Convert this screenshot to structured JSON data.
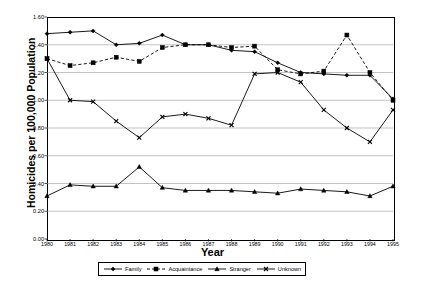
{
  "chart_data": {
    "type": "line",
    "title": "",
    "xlabel": "Year",
    "ylabel": "Homicides per 100,000 Population",
    "xlim": [
      1980,
      1995
    ],
    "ylim": [
      0.0,
      1.6
    ],
    "grid": true,
    "legend_position": "bottom",
    "categories": [
      "1980",
      "1981",
      "1982",
      "1983",
      "1984",
      "1985",
      "1986",
      "1987",
      "1988",
      "1989",
      "1990",
      "1991",
      "1992",
      "1993",
      "1994",
      "1995"
    ],
    "x": [
      1980,
      1981,
      1982,
      1983,
      1984,
      1985,
      1986,
      1987,
      1988,
      1989,
      1990,
      1991,
      1992,
      1993,
      1994,
      1995
    ],
    "ytick_labels": [
      "0.00",
      "0.20",
      "0.40",
      "0.60",
      "0.80",
      "1.00",
      "1.20",
      "1.40",
      "1.60"
    ],
    "ytick_values": [
      0.0,
      0.2,
      0.4,
      0.6,
      0.8,
      1.0,
      1.2,
      1.4,
      1.6
    ],
    "xtick_labels": [
      "1980",
      "1981",
      "1982",
      "1983",
      "1984",
      "1985",
      "1986",
      "1987",
      "1988",
      "1989",
      "1990",
      "1991",
      "1992",
      "1993",
      "1994",
      "1995"
    ],
    "series": [
      {
        "name": "Family",
        "marker": "diamond",
        "dash": "solid",
        "color": "#000000",
        "values": [
          1.48,
          1.49,
          1.5,
          1.4,
          1.41,
          1.47,
          1.4,
          1.4,
          1.36,
          1.35,
          1.27,
          1.2,
          1.19,
          1.18,
          1.18,
          1.01
        ]
      },
      {
        "name": "Acquaintance",
        "marker": "square",
        "dash": "dashed",
        "color": "#000000",
        "values": [
          1.3,
          1.25,
          1.27,
          1.31,
          1.28,
          1.38,
          1.4,
          1.4,
          1.38,
          1.39,
          1.22,
          1.19,
          1.21,
          1.47,
          1.2,
          1.0
        ]
      },
      {
        "name": "Stranger",
        "marker": "triangle",
        "dash": "solid",
        "color": "#000000",
        "values": [
          0.31,
          0.39,
          0.38,
          0.38,
          0.52,
          0.37,
          0.35,
          0.35,
          0.35,
          0.34,
          0.33,
          0.36,
          0.35,
          0.34,
          0.31,
          0.38
        ]
      },
      {
        "name": "Unknown",
        "marker": "x",
        "dash": "solid",
        "color": "#000000",
        "values": [
          1.3,
          1.0,
          0.99,
          0.85,
          0.73,
          0.88,
          0.9,
          0.87,
          0.82,
          1.19,
          1.2,
          1.13,
          0.93,
          0.8,
          0.7,
          0.93
        ]
      }
    ]
  },
  "legend": {
    "items": [
      {
        "label": "Family"
      },
      {
        "label": "Acquaintance"
      },
      {
        "label": "Stranger"
      },
      {
        "label": "Unknown"
      }
    ]
  }
}
